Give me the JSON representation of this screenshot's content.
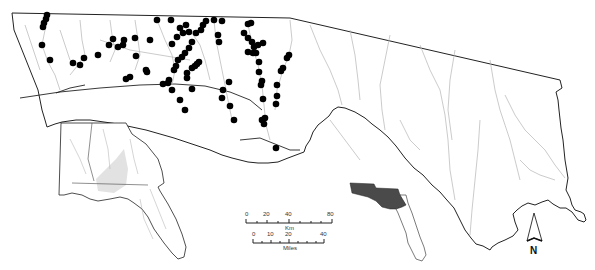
{
  "map": {
    "title": "Florida Panhandle river basins with sampling sites",
    "colors": {
      "background": "#ffffff",
      "boundary": "#222222",
      "rivers": "#b5b5b5",
      "sites": "#000000",
      "inset_highlight": "#4a4a4a",
      "inset_watershed": "#e2e2e2"
    },
    "sites": [
      [
        47,
        15
      ],
      [
        46,
        19
      ],
      [
        44,
        23
      ],
      [
        43,
        27
      ],
      [
        42,
        45
      ],
      [
        50,
        60
      ],
      [
        73,
        63
      ],
      [
        80,
        65
      ],
      [
        84,
        58
      ],
      [
        98,
        55
      ],
      [
        109,
        45
      ],
      [
        113,
        39
      ],
      [
        118,
        47
      ],
      [
        123,
        45
      ],
      [
        124,
        40
      ],
      [
        135,
        38
      ],
      [
        136,
        56
      ],
      [
        147,
        72
      ],
      [
        157,
        20
      ],
      [
        171,
        20
      ],
      [
        186,
        25
      ],
      [
        180,
        28
      ],
      [
        189,
        32
      ],
      [
        172,
        44
      ],
      [
        177,
        37
      ],
      [
        183,
        33
      ],
      [
        214,
        20
      ],
      [
        222,
        21
      ],
      [
        218,
        35
      ],
      [
        219,
        42
      ],
      [
        196,
        33
      ],
      [
        201,
        30
      ],
      [
        203,
        25
      ],
      [
        206,
        21
      ],
      [
        192,
        42
      ],
      [
        189,
        48
      ],
      [
        185,
        53
      ],
      [
        182,
        57
      ],
      [
        178,
        60
      ],
      [
        176,
        66
      ],
      [
        174,
        70
      ],
      [
        199,
        62
      ],
      [
        197,
        64
      ],
      [
        195,
        66
      ],
      [
        192,
        68
      ],
      [
        187,
        73
      ],
      [
        187,
        78
      ],
      [
        248,
        24
      ],
      [
        251,
        23
      ],
      [
        244,
        33
      ],
      [
        248,
        38
      ],
      [
        252,
        42
      ],
      [
        254,
        47
      ],
      [
        258,
        45
      ],
      [
        263,
        43
      ],
      [
        256,
        53
      ],
      [
        248,
        52
      ],
      [
        253,
        53
      ],
      [
        259,
        62
      ],
      [
        259,
        72
      ],
      [
        262,
        81
      ],
      [
        261,
        85
      ],
      [
        263,
        99
      ],
      [
        265,
        118
      ],
      [
        262,
        120
      ],
      [
        264,
        124
      ],
      [
        289,
        55
      ],
      [
        287,
        58
      ],
      [
        283,
        68
      ],
      [
        281,
        71
      ],
      [
        277,
        85
      ],
      [
        277,
        96
      ],
      [
        276,
        104
      ],
      [
        229,
        82
      ],
      [
        223,
        90
      ],
      [
        222,
        98
      ],
      [
        230,
        106
      ],
      [
        234,
        120
      ],
      [
        168,
        83
      ],
      [
        172,
        90
      ],
      [
        163,
        84
      ],
      [
        169,
        80
      ],
      [
        192,
        89
      ],
      [
        180,
        100
      ],
      [
        185,
        110
      ],
      [
        276,
        148
      ],
      [
        146,
        70
      ],
      [
        130,
        77
      ],
      [
        126,
        79
      ],
      [
        150,
        40
      ]
    ],
    "scale_bar": {
      "km": {
        "ticks": [
          "0",
          "20",
          "40",
          "80"
        ],
        "unit": "Km"
      },
      "miles": {
        "ticks": [
          "0",
          "10",
          "20",
          "40"
        ],
        "unit": "Miles"
      }
    },
    "north_arrow": {
      "label": "N"
    },
    "inset_se_us": {
      "label": "Southeastern US (AL, GA, FL) watershed inset"
    },
    "inset_florida": {
      "label": "Florida locator inset"
    }
  }
}
